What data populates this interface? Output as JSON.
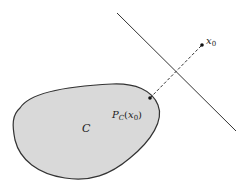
{
  "diagram": {
    "set_label": "C",
    "point_label_base": "x",
    "point_label_sub": "0",
    "projection_label_P": "P",
    "projection_label_sub": "C",
    "projection_label_arg_open": "(",
    "projection_label_arg_x": "x",
    "projection_label_arg_sub": "0",
    "projection_label_arg_close": ")",
    "colors": {
      "set_fill": "#d9d9d9",
      "stroke": "#333333",
      "background": "#ffffff"
    },
    "elements": {
      "set_C": "convex set (gray blob)",
      "point_x0": {
        "x": 202,
        "y": 45
      },
      "projection_point": {
        "x": 150,
        "y": 98
      },
      "separating_line": {
        "x1": 117,
        "y1": 13,
        "x2": 236,
        "y2": 131
      },
      "projection_segment": "dashed line from projection point to x0"
    }
  }
}
